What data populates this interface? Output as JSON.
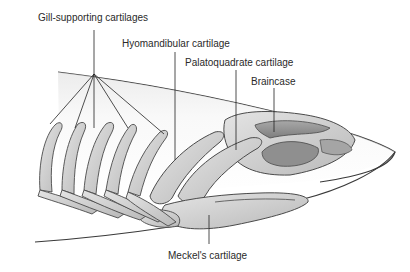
{
  "diagram": {
    "labels": [
      {
        "id": "gill",
        "text": "Gill-supporting cartilages",
        "x": 38,
        "y": 13
      },
      {
        "id": "hyomandibular",
        "text": "Hyomandibular cartilage",
        "x": 122,
        "y": 39
      },
      {
        "id": "palatoquadrate",
        "text": "Palatoquadrate cartilage",
        "x": 185,
        "y": 58
      },
      {
        "id": "braincase",
        "text": "Braincase",
        "x": 251,
        "y": 77
      },
      {
        "id": "meckels",
        "text": "Meckel's cartilage",
        "x": 168,
        "y": 250
      }
    ],
    "colors": {
      "cartilage_fill": "#cfcfcf",
      "cartilage_dark": "#9a9a9a",
      "outline": "#4a4a4a",
      "body_shade": "#e9e9e9",
      "leader_line": "#222222",
      "text": "#2a2a2a"
    }
  }
}
